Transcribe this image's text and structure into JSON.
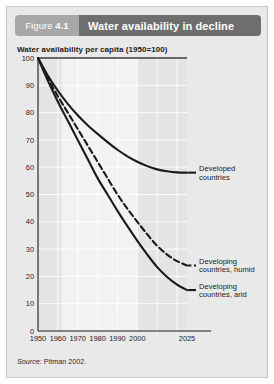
{
  "figure": {
    "number_prefix": "Figure",
    "number": "4.1",
    "title": "Water availability in decline",
    "subtitle": "Water availability per capita (1950=100)",
    "source_word": "Source:",
    "source_text": " Pitman 2002."
  },
  "colors": {
    "card_background": "#e9e9e9",
    "number_box": "#a8a8a8",
    "title_box": "#6e6e6e",
    "plot_background": "#e4e4e4",
    "plot_band": "#f2f2f2",
    "gridline": "#ffffff",
    "curve": "#1a1a1a",
    "axis": "#1a1a1a"
  },
  "chart_data": {
    "type": "line",
    "title": "Water availability in decline",
    "subtitle": "Water availability per capita (1950=100)",
    "xlabel": "",
    "ylabel": "Water availability per capita (1950=100)",
    "xlim": [
      1950,
      2025
    ],
    "ylim": [
      0,
      100
    ],
    "ytick_labels": [
      "0",
      "10",
      "20",
      "30",
      "40",
      "50",
      "60",
      "70",
      "80",
      "90",
      "100"
    ],
    "ytick_values": [
      0,
      10,
      20,
      30,
      40,
      50,
      60,
      70,
      80,
      90,
      100
    ],
    "xtick_labels": [
      "1950",
      "1960",
      "1970",
      "1980",
      "1990",
      "2000",
      "2025"
    ],
    "xtick_values": [
      1950,
      1960,
      1970,
      1980,
      1990,
      2000,
      2025
    ],
    "grid": true,
    "legend_position": "right-inline-annotations",
    "reference_line_y": 100,
    "shaded_band_x": [
      1962,
      2000
    ],
    "x": [
      1950,
      1955,
      1960,
      1965,
      1970,
      1975,
      1980,
      1985,
      1990,
      1995,
      2000,
      2005,
      2010,
      2015,
      2020,
      2025
    ],
    "series": [
      {
        "name": "Developed countries",
        "label_lines": [
          "Developed",
          "countries"
        ],
        "style": "solid",
        "color": "#1a1a1a",
        "values": [
          100,
          93.5,
          88.0,
          83.2,
          79.0,
          75.4,
          72.2,
          69.2,
          66.4,
          64.0,
          62.0,
          60.4,
          59.2,
          58.5,
          58.1,
          58.0
        ]
      },
      {
        "name": "Developing countries, humid",
        "label_lines": [
          "Developing",
          "countries, humid"
        ],
        "style": "dashed",
        "color": "#1a1a1a",
        "values": [
          100,
          92.5,
          86.0,
          80.0,
          74.0,
          68.0,
          62.0,
          56.0,
          50.0,
          44.8,
          40.0,
          35.4,
          31.2,
          28.0,
          25.6,
          24.0
        ]
      },
      {
        "name": "Developing countries, arid",
        "label_lines": [
          "Developing",
          "countries, arid"
        ],
        "style": "solid",
        "color": "#1a1a1a",
        "values": [
          100,
          91.6,
          84.0,
          77.0,
          70.0,
          63.0,
          56.0,
          50.0,
          44.0,
          38.4,
          33.0,
          28.0,
          23.4,
          19.8,
          17.0,
          15.0
        ]
      }
    ]
  }
}
